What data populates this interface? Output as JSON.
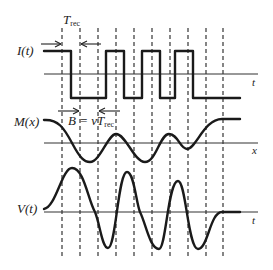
{
  "labels": {
    "trec": "T",
    "trec_sub": "rec",
    "current": "I(t)",
    "magnetization": "M(x)",
    "voltage": "V(t)",
    "axis_t_top": "t",
    "axis_x": "x",
    "axis_t_bottom": "t",
    "bitlength_prefix": "B = vT",
    "bitlength_sub": "rec"
  },
  "colors": {
    "ink": "#1a1a1a",
    "background": "#ffffff"
  },
  "layout": {
    "dashed_x": [
      62,
      80,
      98,
      116,
      134,
      152,
      170,
      188,
      206,
      223
    ],
    "dashed_y_top": 28,
    "dashed_y_bottom": 258,
    "axes": {
      "current_y": 74,
      "magnetization_y": 143,
      "voltage_y": 212,
      "x_start": 44,
      "x_end": 258
    }
  },
  "waveforms": {
    "current": {
      "high": 51,
      "low": 98,
      "transitions_x": [
        44,
        71,
        106,
        124,
        142,
        160,
        175,
        193,
        240
      ],
      "levels": [
        "high",
        "low",
        "high",
        "low",
        "high",
        "low",
        "high",
        "low",
        "high"
      ]
    },
    "magnetization_path": "M44,120 C58,119 64,128 72,143 C80,158 84,162 90,162 C100,162 108,134 116,134 C126,134 134,162 145,162 C156,162 160,134 169,134 C178,134 180,149 187,149 C196,149 204,119 222,119 L240,119",
    "voltage_path": "M44,209 C56,207 62,168 72,168 C84,168 88,200 95,212 C100,224 102,248 108,248 C116,248 118,172 127,172 C134,172 136,202 140,212 C146,224 150,249 159,249 C166,249 168,181 178,181 C186,181 188,249 198,249 C208,249 210,212 222,212 L240,212"
  }
}
